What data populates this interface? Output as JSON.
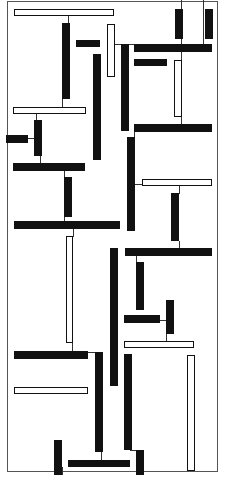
{
  "artwork": {
    "description": "Abstract composition of black and white outlined rectangles connected by thin lines",
    "colors": {
      "ink": "#111111",
      "paper": "#ffffff",
      "line": "#333333"
    },
    "frame": {
      "x": 7,
      "y": 1,
      "w": 211,
      "h": 471
    },
    "shapes": [
      {
        "t": "w",
        "x": 14,
        "y": 9,
        "w": 100,
        "h": 7
      },
      {
        "t": "b",
        "x": 62,
        "y": 23,
        "w": 8,
        "h": 76
      },
      {
        "t": "b",
        "x": 76,
        "y": 40,
        "w": 24,
        "h": 7
      },
      {
        "t": "w",
        "x": 107,
        "y": 24,
        "w": 8,
        "h": 53
      },
      {
        "t": "b",
        "x": 93,
        "y": 54,
        "w": 8,
        "h": 106
      },
      {
        "t": "b",
        "x": 121,
        "y": 44,
        "w": 8,
        "h": 87
      },
      {
        "t": "b",
        "x": 175,
        "y": 9,
        "w": 8,
        "h": 30
      },
      {
        "t": "b",
        "x": 205,
        "y": 9,
        "w": 8,
        "h": 30
      },
      {
        "t": "b",
        "x": 134,
        "y": 44,
        "w": 78,
        "h": 8
      },
      {
        "t": "b",
        "x": 134,
        "y": 59,
        "w": 33,
        "h": 7
      },
      {
        "t": "w",
        "x": 174,
        "y": 60,
        "w": 8,
        "h": 57
      },
      {
        "t": "w",
        "x": 13,
        "y": 107,
        "w": 73,
        "h": 7
      },
      {
        "t": "b",
        "x": 34,
        "y": 120,
        "w": 8,
        "h": 36
      },
      {
        "t": "b",
        "x": 6,
        "y": 135,
        "w": 22,
        "h": 8
      },
      {
        "t": "b",
        "x": 134,
        "y": 124,
        "w": 78,
        "h": 8
      },
      {
        "t": "b",
        "x": 127,
        "y": 137,
        "w": 8,
        "h": 94
      },
      {
        "t": "b",
        "x": 13,
        "y": 163,
        "w": 72,
        "h": 8
      },
      {
        "t": "b",
        "x": 64,
        "y": 177,
        "w": 8,
        "h": 40
      },
      {
        "t": "w",
        "x": 142,
        "y": 179,
        "w": 70,
        "h": 7
      },
      {
        "t": "b",
        "x": 171,
        "y": 193,
        "w": 8,
        "h": 48
      },
      {
        "t": "b",
        "x": 14,
        "y": 221,
        "w": 106,
        "h": 8
      },
      {
        "t": "w",
        "x": 66,
        "y": 236,
        "w": 7,
        "h": 107
      },
      {
        "t": "b",
        "x": 110,
        "y": 248,
        "w": 8,
        "h": 138
      },
      {
        "t": "b",
        "x": 125,
        "y": 248,
        "w": 87,
        "h": 8
      },
      {
        "t": "b",
        "x": 136,
        "y": 262,
        "w": 8,
        "h": 48
      },
      {
        "t": "b",
        "x": 166,
        "y": 300,
        "w": 8,
        "h": 34
      },
      {
        "t": "b",
        "x": 124,
        "y": 315,
        "w": 36,
        "h": 8
      },
      {
        "t": "w",
        "x": 124,
        "y": 341,
        "w": 70,
        "h": 7
      },
      {
        "t": "b",
        "x": 14,
        "y": 351,
        "w": 74,
        "h": 8
      },
      {
        "t": "b",
        "x": 95,
        "y": 352,
        "w": 8,
        "h": 100
      },
      {
        "t": "b",
        "x": 124,
        "y": 354,
        "w": 8,
        "h": 96
      },
      {
        "t": "w",
        "x": 187,
        "y": 355,
        "w": 8,
        "h": 116
      },
      {
        "t": "w",
        "x": 14,
        "y": 387,
        "w": 74,
        "h": 7
      },
      {
        "t": "b",
        "x": 54,
        "y": 440,
        "w": 8,
        "h": 35
      },
      {
        "t": "b",
        "x": 68,
        "y": 460,
        "w": 62,
        "h": 7
      },
      {
        "t": "b",
        "x": 136,
        "y": 450,
        "w": 8,
        "h": 25
      }
    ],
    "lines": [
      {
        "x": 68,
        "y": 16,
        "w": 1,
        "h": 8
      },
      {
        "x": 115,
        "y": 44,
        "w": 20,
        "h": 1
      },
      {
        "x": 181,
        "y": 0,
        "w": 1,
        "h": 124
      },
      {
        "x": 203,
        "y": 0,
        "w": 1,
        "h": 44
      },
      {
        "x": 62,
        "y": 99,
        "w": 1,
        "h": 9
      },
      {
        "x": 36,
        "y": 114,
        "w": 1,
        "h": 8
      },
      {
        "x": 28,
        "y": 138,
        "w": 7,
        "h": 1
      },
      {
        "x": 40,
        "y": 156,
        "w": 1,
        "h": 8
      },
      {
        "x": 64,
        "y": 171,
        "w": 1,
        "h": 8
      },
      {
        "x": 64,
        "y": 217,
        "w": 1,
        "h": 5
      },
      {
        "x": 73,
        "y": 229,
        "w": 1,
        "h": 8
      },
      {
        "x": 134,
        "y": 131,
        "w": 1,
        "h": 8
      },
      {
        "x": 135,
        "y": 184,
        "w": 8,
        "h": 1
      },
      {
        "x": 179,
        "y": 186,
        "w": 1,
        "h": 8
      },
      {
        "x": 179,
        "y": 241,
        "w": 1,
        "h": 8
      },
      {
        "x": 136,
        "y": 256,
        "w": 1,
        "h": 7
      },
      {
        "x": 160,
        "y": 320,
        "w": 8,
        "h": 1
      },
      {
        "x": 166,
        "y": 334,
        "w": 1,
        "h": 8
      },
      {
        "x": 72,
        "y": 343,
        "w": 1,
        "h": 9
      },
      {
        "x": 88,
        "y": 352,
        "w": 8,
        "h": 1
      },
      {
        "x": 101,
        "y": 450,
        "w": 1,
        "h": 11
      },
      {
        "x": 130,
        "y": 450,
        "w": 8,
        "h": 1
      },
      {
        "x": 62,
        "y": 467,
        "w": 1,
        "h": 8
      },
      {
        "x": 136,
        "y": 467,
        "w": 1,
        "h": 8
      }
    ]
  }
}
